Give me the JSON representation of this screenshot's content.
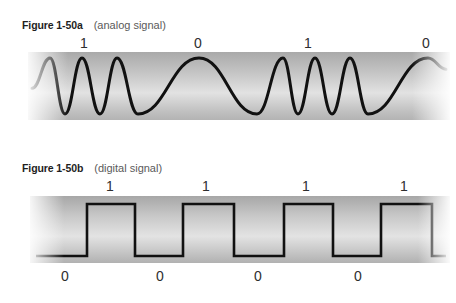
{
  "figures": [
    {
      "number": "Figure 1-50a",
      "caption": "(analog signal)"
    },
    {
      "number": "Figure 1-50b",
      "caption": "(digital signal)"
    }
  ],
  "colors": {
    "signal": "#111111",
    "band_edge": "#adadad",
    "band_mid": "#e3e3e3",
    "background": "#ffffff"
  },
  "chart_data": [
    {
      "type": "line",
      "title": "Figure 1-50a (analog signal)",
      "xlabel": "",
      "ylabel": "",
      "grid": false,
      "legend": null,
      "bit_labels": [
        "1",
        "0",
        "1",
        "0"
      ],
      "cycles_per_bit": [
        3,
        1,
        3,
        1
      ],
      "encoding": "high frequency = 1, low frequency = 0",
      "points": [
        [
          32,
          0.46
        ],
        [
          50,
          1
        ],
        [
          65,
          0
        ],
        [
          82,
          1
        ],
        [
          100,
          0
        ],
        [
          117,
          1
        ],
        [
          138,
          0
        ],
        [
          199,
          1
        ],
        [
          257,
          0
        ],
        [
          283,
          1
        ],
        [
          298,
          0
        ],
        [
          315,
          1
        ],
        [
          332,
          0
        ],
        [
          350,
          1
        ],
        [
          368,
          0
        ],
        [
          428,
          1
        ],
        [
          446,
          0.8
        ]
      ]
    },
    {
      "type": "line",
      "step": true,
      "title": "Figure 1-50b (digital signal)",
      "xlabel": "",
      "ylabel": "",
      "grid": false,
      "legend": null,
      "bit_labels": [
        "0",
        "1",
        "0",
        "1",
        "0",
        "1",
        "0",
        "1"
      ],
      "levels": [
        0,
        1,
        0,
        1,
        0,
        1,
        0,
        1,
        0
      ],
      "edges_x": [
        36,
        87,
        135,
        183,
        234,
        284,
        333,
        381,
        432,
        446
      ]
    }
  ]
}
